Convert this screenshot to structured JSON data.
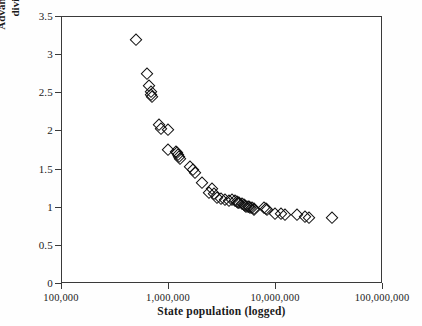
{
  "chart_data": {
    "type": "scatter",
    "title": "",
    "xlabel": "State population (logged)",
    "ylabel": "Advantage ratio (percent of electoral votes divided by percent of US population)",
    "xscale": "log",
    "yscale": "linear",
    "xlim": [
      100000,
      100000000
    ],
    "ylim": [
      0,
      3.5
    ],
    "grid": false,
    "legend": null,
    "marker": "open-diamond",
    "marker_color": "#101010",
    "xticks": [
      100000,
      1000000,
      10000000,
      100000000
    ],
    "xtick_labels": [
      "100,000",
      "1,000,000",
      "10,000,000",
      "100,000,000"
    ],
    "yticks": [
      0,
      0.5,
      1,
      1.5,
      2,
      2.5,
      3,
      3.5
    ],
    "ytick_labels": [
      "0",
      "0.5",
      "1",
      "1.5",
      "2",
      "2.5",
      "3",
      "3.5"
    ],
    "n_points": 51,
    "points": [
      {
        "x": 500000,
        "y": 3.18
      },
      {
        "x": 640000,
        "y": 2.74
      },
      {
        "x": 670000,
        "y": 2.58
      },
      {
        "x": 690000,
        "y": 2.5
      },
      {
        "x": 700000,
        "y": 2.46
      },
      {
        "x": 710000,
        "y": 2.44
      },
      {
        "x": 820000,
        "y": 2.07
      },
      {
        "x": 860000,
        "y": 2.02
      },
      {
        "x": 1000000,
        "y": 2.01
      },
      {
        "x": 1010000,
        "y": 1.74
      },
      {
        "x": 1200000,
        "y": 1.72
      },
      {
        "x": 1220000,
        "y": 1.7
      },
      {
        "x": 1250000,
        "y": 1.68
      },
      {
        "x": 1270000,
        "y": 1.65
      },
      {
        "x": 1290000,
        "y": 1.63
      },
      {
        "x": 1600000,
        "y": 1.52
      },
      {
        "x": 1700000,
        "y": 1.48
      },
      {
        "x": 1800000,
        "y": 1.44
      },
      {
        "x": 2100000,
        "y": 1.31
      },
      {
        "x": 2600000,
        "y": 1.23
      },
      {
        "x": 2400000,
        "y": 1.18
      },
      {
        "x": 2700000,
        "y": 1.17
      },
      {
        "x": 2900000,
        "y": 1.12
      },
      {
        "x": 3100000,
        "y": 1.1
      },
      {
        "x": 3400000,
        "y": 1.09
      },
      {
        "x": 3700000,
        "y": 1.08
      },
      {
        "x": 4000000,
        "y": 1.09
      },
      {
        "x": 4200000,
        "y": 1.07
      },
      {
        "x": 4400000,
        "y": 1.06
      },
      {
        "x": 4500000,
        "y": 1.05
      },
      {
        "x": 4600000,
        "y": 1.05
      },
      {
        "x": 4900000,
        "y": 1.04
      },
      {
        "x": 5100000,
        "y": 1.02
      },
      {
        "x": 5300000,
        "y": 1.01
      },
      {
        "x": 5400000,
        "y": 1.0
      },
      {
        "x": 5600000,
        "y": 1.0
      },
      {
        "x": 5700000,
        "y": 0.99
      },
      {
        "x": 5900000,
        "y": 0.98
      },
      {
        "x": 6100000,
        "y": 0.98
      },
      {
        "x": 6300000,
        "y": 0.97
      },
      {
        "x": 6400000,
        "y": 0.96
      },
      {
        "x": 7900000,
        "y": 0.98
      },
      {
        "x": 8200000,
        "y": 0.97
      },
      {
        "x": 8400000,
        "y": 0.96
      },
      {
        "x": 9900000,
        "y": 0.91
      },
      {
        "x": 11400000,
        "y": 0.9
      },
      {
        "x": 12300000,
        "y": 0.89
      },
      {
        "x": 15900000,
        "y": 0.89
      },
      {
        "x": 18900000,
        "y": 0.86
      },
      {
        "x": 20800000,
        "y": 0.85
      },
      {
        "x": 33900000,
        "y": 0.85
      }
    ]
  }
}
